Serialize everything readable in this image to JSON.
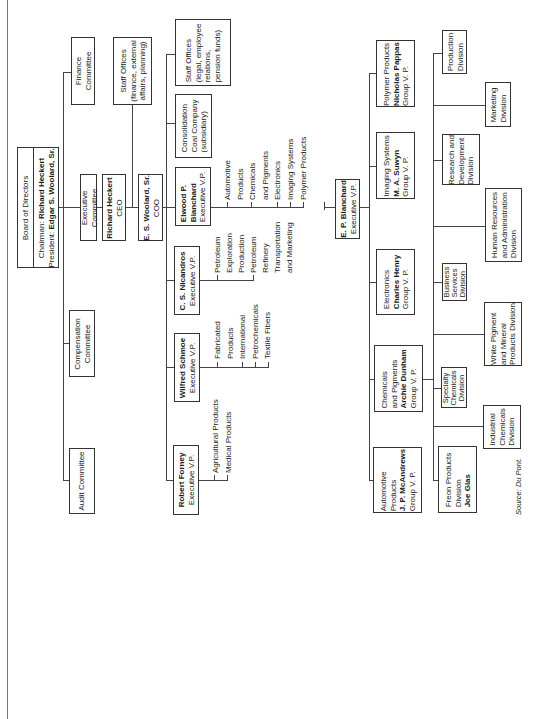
{
  "board": {
    "title": "Board of Directors",
    "chairman_label": "Chairman:",
    "chairman": "Richard Heckert",
    "president_label": "President:",
    "president": "Edgar S. Woolard, Sr."
  },
  "committees": [
    {
      "line1": "Finance",
      "line2": "Committee"
    },
    {
      "line1": "Executive",
      "line2": "Committee"
    },
    {
      "line1": "Compensation",
      "line2": "Committee"
    },
    {
      "line1": "Audit Committee",
      "line2": ""
    }
  ],
  "ceo": {
    "name": "Richard Heckert",
    "title": "CEO"
  },
  "coo": {
    "name": "E. S. Woolard, Sr.",
    "title": "COO"
  },
  "staff_offices_corporate": {
    "line1": "Staff Offices",
    "line2": "(finance, external",
    "line3": "affairs, planning)"
  },
  "staff_offices_legal": {
    "line1": "Staff Offices",
    "line2": "(legal, employee",
    "line3": "relations,",
    "line4": "pension funds)"
  },
  "consolidation": {
    "line1": "Consolidation",
    "line2": "Coal Company",
    "line3": "(subsidiary)"
  },
  "evps": [
    {
      "name1": "Elwood P.",
      "name2": "Blanchard",
      "title": "Executive V.P.",
      "items": [
        "Automotive",
        "Products",
        "Chemicals",
        "and Pigments",
        "Electronics",
        "Imaging Systems",
        "Polymer Products"
      ]
    },
    {
      "name1": "C. S. Nicandros",
      "name2": "",
      "title": "Executive V.P.",
      "items": [
        "Petroleum",
        "Exploration",
        "Production",
        "Petroleum",
        "Refinery",
        "Transportation",
        "and Marketing"
      ]
    },
    {
      "name1": "Wilfred Schmoe",
      "name2": "",
      "title": "Executive V.P.",
      "items": [
        "Fabricated",
        "Products",
        "International",
        "Petrochemicals",
        "Textile Fibers"
      ]
    },
    {
      "name1": "Robert Forney",
      "name2": "",
      "title": "Executive V.P.",
      "items": [
        "Agricultural Products",
        "Medical Products"
      ]
    }
  ],
  "ep_blanchard": {
    "name": "E. P. Blanchard",
    "title": "Executive V.P."
  },
  "group_vps": [
    {
      "unit1": "Polymer Products",
      "unit2": "",
      "name": "Nicholas Pappas",
      "title": "Group V. P."
    },
    {
      "unit1": "Imaging Systems",
      "unit2": "",
      "name": "M. A. Suwyn",
      "title": "Group V. P."
    },
    {
      "unit1": "Electronics",
      "unit2": "",
      "name": "Charles Henry",
      "title": "Group V. P."
    },
    {
      "unit1": "Chemicals",
      "unit2": "and Pigments",
      "name": "Archie Dunham",
      "title": "Group V. P."
    },
    {
      "unit1": "Automotive",
      "unit2": "Products",
      "name": "J. P. McAndrews",
      "title": "Group V. P."
    }
  ],
  "divisions": [
    {
      "l1": "Production",
      "l2": "Division",
      "l3": ""
    },
    {
      "l1": "Marketing",
      "l2": "Division",
      "l3": ""
    },
    {
      "l1": "Research and",
      "l2": "Development",
      "l3": "Division"
    },
    {
      "l1": "Human Resources",
      "l2": "and Administration",
      "l3": "Division"
    },
    {
      "l1": "Business",
      "l2": "Services",
      "l3": "Division"
    },
    {
      "l1": "White Pigment",
      "l2": "and Mineral",
      "l3": "Products Division"
    },
    {
      "l1": "Specialty",
      "l2": "Chemicals",
      "l3": "Division"
    },
    {
      "l1": "Industrial",
      "l2": "Chemicals",
      "l3": "Division"
    },
    {
      "l1": "Freon Products",
      "l2": "Division",
      "l3": "Joe Glas"
    }
  ],
  "source": "Source: Du Pont.",
  "colors": {
    "line": "#444444",
    "border": "#333333",
    "text": "#1a1a1a",
    "background": "#ffffff"
  }
}
